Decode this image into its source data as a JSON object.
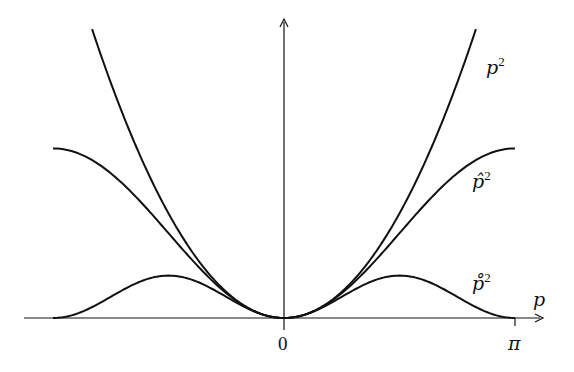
{
  "chart_data": {
    "type": "line",
    "title": "",
    "xlabel": "p",
    "ylabel": "",
    "xlim": [
      -3.1416,
      3.1416
    ],
    "ylim": [
      0,
      7.0
    ],
    "grid": false,
    "legend": "inline labels at right",
    "x_ticks": [
      {
        "value": 0,
        "label": "0"
      },
      {
        "value": 3.1416,
        "label": "π"
      }
    ],
    "series": [
      {
        "name": "p^2",
        "label": "p",
        "accent": "",
        "formula": "p^2",
        "x_range": [
          -2.61,
          2.61
        ],
        "x": [
          -2.61,
          -2.0,
          -1.5,
          -1.0,
          -0.5,
          0,
          0.5,
          1.0,
          1.5,
          2.0,
          2.61
        ],
        "values": [
          6.81,
          4.0,
          2.25,
          1.0,
          0.25,
          0,
          0.25,
          1.0,
          2.25,
          4.0,
          6.81
        ]
      },
      {
        "name": "p-hat^2",
        "label": "p̂",
        "accent": "hat",
        "formula": "4 sin^2(p/2)",
        "x_range": [
          -3.1416,
          3.1416
        ],
        "x": [
          -3.1416,
          -2.5,
          -2.0,
          -1.5,
          -1.0,
          -0.5,
          0,
          0.5,
          1.0,
          1.5,
          2.0,
          2.5,
          3.1416
        ],
        "values": [
          4.0,
          3.6,
          2.83,
          1.86,
          0.92,
          0.24,
          0,
          0.24,
          0.92,
          1.86,
          2.83,
          3.6,
          4.0
        ]
      },
      {
        "name": "p-ring^2",
        "label": "p̊",
        "accent": "ring",
        "formula": "sin^2(p)",
        "x_range": [
          -3.1416,
          3.1416
        ],
        "x": [
          -3.1416,
          -2.5,
          -2.0,
          -1.5708,
          -1.0,
          -0.5,
          0,
          0.5,
          1.0,
          1.5708,
          2.0,
          2.5,
          3.1416
        ],
        "values": [
          0,
          0.36,
          0.83,
          1.0,
          0.71,
          0.23,
          0,
          0.23,
          0.71,
          1.0,
          0.83,
          0.36,
          0
        ]
      }
    ],
    "labels": {
      "p2": {
        "base": "p",
        "sup": "2"
      },
      "phat2": {
        "base": "p̂",
        "sup": "2"
      },
      "pring2": {
        "base": "p̊",
        "sup": "2"
      },
      "x_axis": "p",
      "origin": "0",
      "pi": "π"
    }
  }
}
